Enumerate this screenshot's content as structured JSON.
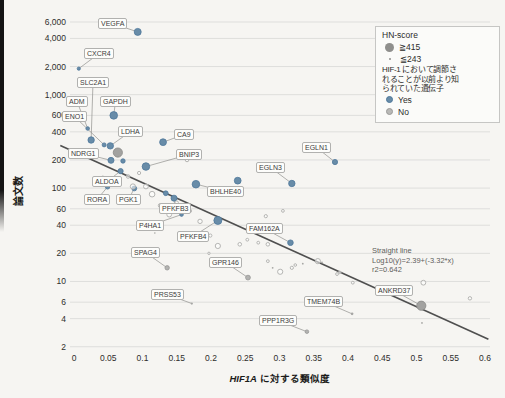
{
  "page": {
    "background": "#f6f5f2"
  },
  "axis": {
    "y_label": "論文数",
    "x_label_gene": "HIF1A",
    "x_label_rest": " に対する類似度",
    "x_tick_labels": [
      "0",
      "0.05",
      "0.1",
      "0.15",
      "0.2",
      "0.25",
      "0.3",
      "0.35",
      "0.4",
      "0.45",
      "0.5",
      "0.55",
      "0.6"
    ],
    "y_tick_labels": [
      "6,000",
      "4,000",
      "2,000",
      "1,000",
      "600",
      "400",
      "200",
      "100",
      "60",
      "40",
      "20",
      "10",
      "6",
      "4",
      "2"
    ]
  },
  "legend": {
    "title": "HN-score",
    "big_label": "≧415",
    "small_label": "≦243",
    "known_line1": "HIF-1 において調節さ",
    "known_line2": "れることが以前より知",
    "known_line3": "られていた遺伝子",
    "yes_label": "Yes",
    "no_label": "No"
  },
  "annotation": {
    "line1": "Straight line",
    "line2": "Log10(y)=2.39+(-3.32*x)",
    "line3": "r2=0.642"
  },
  "chart_data": {
    "type": "scatter",
    "title": "",
    "xlabel": "HIF1A に対する類似度",
    "ylabel": "論文数",
    "x_axis": {
      "min": 0,
      "max": 0.6,
      "tick_step": 0.05
    },
    "y_axis": {
      "scale": "log",
      "min": 2,
      "max": 6000,
      "ticks": [
        6000,
        4000,
        2000,
        1000,
        600,
        400,
        200,
        100,
        60,
        40,
        20,
        10,
        6,
        4,
        2
      ]
    },
    "grid": "horizontal-only",
    "legend_position": "top-right",
    "trend_line": {
      "equation": "Log10(y)=2.39+(-3.32*x)",
      "intercept": 2.39,
      "slope": -3.32,
      "r2": 0.642,
      "x_draw_start": -0.02,
      "x_draw_end": 0.605
    },
    "colors": {
      "yes": "#688ca8",
      "yes_stroke": "#4e779a",
      "no_filled": "#b3b3b1",
      "no_big": "#a2a2a0",
      "open_stroke": "#b5b5b3",
      "trend": "#4f4f4f",
      "grid": "#dededc",
      "leader": "#90908e"
    },
    "points": [
      {
        "gene": "VEGFA",
        "x": 0.093,
        "y": 4700,
        "known": "Yes",
        "cls": "yes",
        "r": 3.5,
        "lx": 98,
        "ly": 18
      },
      {
        "gene": "CXCR4",
        "x": 0.007,
        "y": 1900,
        "known": "Yes",
        "cls": "yes",
        "r": 1.6,
        "lx": 84,
        "ly": 48
      },
      {
        "gene": "SLC2A1",
        "x": 0.025,
        "y": 327,
        "known": "Yes",
        "cls": "yes",
        "r": 3.2,
        "lx": 77,
        "ly": 77
      },
      {
        "gene": "ADM",
        "x": 0.02,
        "y": 434,
        "known": "Yes",
        "cls": "yes",
        "r": 1.8,
        "lx": 66,
        "ly": 96
      },
      {
        "gene": "GAPDH",
        "x": 0.058,
        "y": 600,
        "known": "Yes",
        "cls": "yes",
        "r": 3.8,
        "lx": 100,
        "ly": 96
      },
      {
        "gene": "ENO1",
        "x": 0.044,
        "y": 290,
        "known": "Yes",
        "cls": "yes",
        "r": 2.0,
        "lx": 62,
        "ly": 111
      },
      {
        "gene": "LDHA",
        "x": 0.053,
        "y": 283,
        "known": "Yes",
        "cls": "yes",
        "r": 3.2,
        "lx": 118,
        "ly": 126
      },
      {
        "gene": "CA9",
        "x": 0.13,
        "y": 310,
        "known": "Yes",
        "cls": "yes",
        "r": 3.4,
        "lx": 174,
        "ly": 129
      },
      {
        "gene": "NDRG1",
        "x": 0.054,
        "y": 198,
        "known": "Yes",
        "cls": "yes",
        "r": 3.0,
        "lx": 68,
        "ly": 148
      },
      {
        "gene": "BNIP3",
        "x": 0.105,
        "y": 170,
        "known": "Yes",
        "cls": "yes",
        "r": 3.8,
        "lx": 176,
        "ly": 149
      },
      {
        "gene": "EGLN1",
        "x": 0.381,
        "y": 190,
        "known": "Yes",
        "cls": "yes",
        "r": 2.6,
        "lx": 302,
        "ly": 142
      },
      {
        "gene": "EGLN3",
        "x": 0.318,
        "y": 112,
        "known": "Yes",
        "cls": "yes",
        "r": 3.2,
        "lx": 256,
        "ly": 162
      },
      {
        "gene": "ALDOA",
        "x": 0.068,
        "y": 152,
        "known": "Yes",
        "cls": "yes",
        "r": 2.6,
        "lx": 92,
        "ly": 176
      },
      {
        "gene": "RORA",
        "x": 0.049,
        "y": 103,
        "known": "Yes",
        "cls": "yes",
        "r": 2.2,
        "lx": 84,
        "ly": 194
      },
      {
        "gene": "PGK1",
        "x": 0.088,
        "y": 99,
        "known": "Yes",
        "cls": "yes",
        "r": 2.4,
        "lx": 116,
        "ly": 194
      },
      {
        "gene": "BHLHE40",
        "x": 0.178,
        "y": 110,
        "known": "Yes",
        "cls": "yes",
        "r": 3.8,
        "lx": 207,
        "ly": 186
      },
      {
        "gene": "PFKFB3",
        "x": 0.146,
        "y": 78,
        "known": "Yes",
        "cls": "yes",
        "r": 3.0,
        "lx": 159,
        "ly": 203
      },
      {
        "gene": "P4HA1",
        "x": 0.157,
        "y": 52,
        "known": "Yes",
        "cls": "yes",
        "r": 1.8,
        "lx": 136,
        "ly": 220
      },
      {
        "gene": "PFKFB4",
        "x": 0.21,
        "y": 45,
        "known": "Yes",
        "cls": "yes",
        "r": 4.0,
        "lx": 177,
        "ly": 231
      },
      {
        "gene": "FAM162A",
        "x": 0.316,
        "y": 26,
        "known": "Yes",
        "cls": "yes",
        "r": 2.8,
        "lx": 246,
        "ly": 223
      },
      {
        "gene": "SPAG4",
        "x": 0.136,
        "y": 14,
        "known": "No",
        "cls": "nofill",
        "r": 2.2,
        "lx": 131,
        "ly": 247
      },
      {
        "gene": "GPR146",
        "x": 0.254,
        "y": 11,
        "known": "No",
        "cls": "nofill",
        "r": 2.4,
        "lx": 209,
        "ly": 257
      },
      {
        "gene": "PRSS53",
        "x": 0.172,
        "y": 5.8,
        "known": "No",
        "cls": "dot",
        "r": 1.1,
        "lx": 151,
        "ly": 289
      },
      {
        "gene": "TMEM74B",
        "x": 0.406,
        "y": 4.5,
        "known": "No",
        "cls": "dot",
        "r": 1.3,
        "lx": 304,
        "ly": 296
      },
      {
        "gene": "ANKRD37",
        "x": 0.507,
        "y": 5.5,
        "known": "No",
        "cls": "big",
        "r": 4.6,
        "lx": 375,
        "ly": 285
      },
      {
        "gene": "PPP1R3G",
        "x": 0.34,
        "y": 2.9,
        "known": "No",
        "cls": "nofill",
        "r": 1.8,
        "lx": 259,
        "ly": 315
      },
      {
        "x": 0.064,
        "y": 240,
        "cls": "big",
        "r": 4.6
      },
      {
        "x": 0.0715,
        "y": 195,
        "cls": "yes",
        "r": 2.2
      },
      {
        "x": 0.239,
        "y": 120,
        "cls": "yes",
        "r": 3.4
      },
      {
        "x": 0.134,
        "y": 88,
        "cls": "yes",
        "r": 2.4
      },
      {
        "x": 0.042,
        "y": 128,
        "cls": "open",
        "r": 2.0
      },
      {
        "x": 0.079,
        "y": 133,
        "cls": "open",
        "r": 1.8
      },
      {
        "x": 0.086,
        "y": 104,
        "cls": "open",
        "r": 2.6
      },
      {
        "x": 0.095,
        "y": 145,
        "cls": "open",
        "r": 1.6
      },
      {
        "x": 0.105,
        "y": 104,
        "cls": "open",
        "r": 2.4
      },
      {
        "x": 0.114,
        "y": 86,
        "cls": "open",
        "r": 2.8
      },
      {
        "x": 0.126,
        "y": 65,
        "cls": "open",
        "r": 2.0
      },
      {
        "x": 0.139,
        "y": 52,
        "cls": "open",
        "r": 2.4
      },
      {
        "x": 0.15,
        "y": 70,
        "cls": "open",
        "r": 1.6
      },
      {
        "x": 0.165,
        "y": 200,
        "cls": "open",
        "r": 1.8
      },
      {
        "x": 0.169,
        "y": 57,
        "cls": "open",
        "r": 1.8
      },
      {
        "x": 0.184,
        "y": 44,
        "cls": "open",
        "r": 2.2
      },
      {
        "x": 0.197,
        "y": 20,
        "cls": "open",
        "r": 1.2
      },
      {
        "x": 0.199,
        "y": 31,
        "cls": "open",
        "r": 1.6
      },
      {
        "x": 0.21,
        "y": 24,
        "cls": "open",
        "r": 2.6
      },
      {
        "x": 0.242,
        "y": 25,
        "cls": "open",
        "r": 1.8
      },
      {
        "x": 0.253,
        "y": 28,
        "cls": "open",
        "r": 1.4
      },
      {
        "x": 0.269,
        "y": 26,
        "cls": "open",
        "r": 1.4
      },
      {
        "x": 0.28,
        "y": 50,
        "cls": "open",
        "r": 1.6
      },
      {
        "x": 0.283,
        "y": 25,
        "cls": "open",
        "r": 1.8
      },
      {
        "x": 0.283,
        "y": 16.5,
        "cls": "open",
        "r": 1.4
      },
      {
        "x": 0.301,
        "y": 12.7,
        "cls": "open",
        "r": 2.6
      },
      {
        "x": 0.305,
        "y": 57,
        "cls": "open",
        "r": 1.4
      },
      {
        "x": 0.318,
        "y": 14,
        "cls": "open",
        "r": 1.6
      },
      {
        "x": 0.323,
        "y": 15,
        "cls": "open",
        "r": 1.3
      },
      {
        "x": 0.356,
        "y": 16.5,
        "cls": "open",
        "r": 2.6
      },
      {
        "x": 0.384,
        "y": 12,
        "cls": "open",
        "r": 1.4
      },
      {
        "x": 0.388,
        "y": 12.5,
        "cls": "open",
        "r": 1.3
      },
      {
        "x": 0.407,
        "y": 9.7,
        "cls": "open",
        "r": 1.4
      },
      {
        "x": 0.51,
        "y": 9.7,
        "cls": "open",
        "r": 2.4
      },
      {
        "x": 0.578,
        "y": 6.6,
        "cls": "open",
        "r": 1.7
      },
      {
        "x": 0.228,
        "y": 17,
        "cls": "dot",
        "r": 0.9
      },
      {
        "x": 0.29,
        "y": 14,
        "cls": "dot",
        "r": 0.9
      },
      {
        "x": 0.334,
        "y": 15.5,
        "cls": "dot",
        "r": 0.9
      },
      {
        "x": 0.362,
        "y": 16,
        "cls": "dot",
        "r": 0.9
      },
      {
        "x": 0.508,
        "y": 3.6,
        "cls": "dot",
        "r": 0.9
      },
      {
        "x": 0.118,
        "y": 33,
        "cls": "dot",
        "r": 0.8
      },
      {
        "x": 0.158,
        "y": 29,
        "cls": "dot",
        "r": 0.8
      }
    ]
  }
}
